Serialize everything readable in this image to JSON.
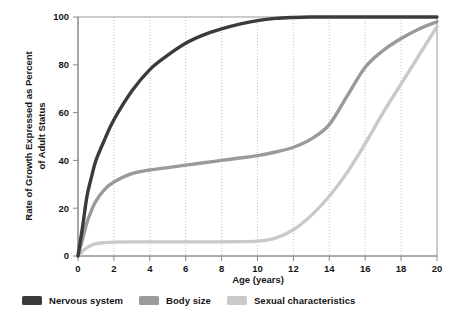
{
  "chart_data": {
    "type": "line",
    "title": "",
    "xlabel": "Age (years)",
    "ylabel": "Rate of Growth Expressed as Percent of Adult Status",
    "ylabel_line1": "Rate of Growth Expressed as Percent",
    "ylabel_line2": "of Adult Status",
    "xlim": [
      0,
      20
    ],
    "ylim": [
      0,
      100
    ],
    "xticks": [
      "0",
      "2",
      "4",
      "6",
      "8",
      "10",
      "12",
      "14",
      "16",
      "18",
      "20"
    ],
    "xtick_values": [
      0,
      2,
      4,
      6,
      8,
      10,
      12,
      14,
      16,
      18,
      20
    ],
    "yticks": [
      "0",
      "20",
      "40",
      "60",
      "80",
      "100"
    ],
    "ytick_values": [
      0,
      20,
      40,
      60,
      80,
      100
    ],
    "grid": "vertical-dotted",
    "legend_position": "below-plot",
    "x": [
      0,
      0.25,
      0.5,
      0.75,
      1,
      1.5,
      2,
      3,
      4,
      5,
      6,
      7,
      8,
      9,
      10,
      11,
      12,
      13,
      14,
      15,
      16,
      17,
      18,
      19,
      20
    ],
    "series": [
      {
        "name": "Nervous system",
        "color": "#3b3b3b",
        "values": [
          0,
          12,
          25,
          33,
          40,
          49,
          57,
          69,
          78,
          84,
          89,
          92.5,
          95,
          97,
          98.5,
          99.4,
          99.8,
          100,
          100,
          100,
          100,
          100,
          100,
          100,
          100
        ]
      },
      {
        "name": "Body size",
        "color": "#9a9a9a",
        "values": [
          0,
          7,
          14,
          19,
          23,
          28,
          31,
          34.5,
          36,
          37,
          38,
          39,
          40,
          41,
          42,
          43.5,
          45.5,
          49,
          55,
          67,
          79,
          86,
          91,
          95,
          98
        ]
      },
      {
        "name": "Sexual characteristics",
        "color": "#c9c9c9",
        "values": [
          0,
          2,
          3.5,
          4.5,
          5.2,
          5.6,
          5.8,
          5.9,
          5.9,
          5.9,
          5.9,
          5.9,
          5.9,
          6,
          6.2,
          7.5,
          11,
          17,
          25,
          35,
          47,
          60,
          72,
          84,
          96
        ]
      }
    ]
  },
  "legend": {
    "items": [
      {
        "label": "Nervous system",
        "color": "#3b3b3b"
      },
      {
        "label": "Body size",
        "color": "#9a9a9a"
      },
      {
        "label": "Sexual characteristics",
        "color": "#c9c9c9"
      }
    ]
  },
  "colors": {
    "nervous_system": "#3b3b3b",
    "body_size": "#9a9a9a",
    "sexual_characteristics": "#c9c9c9",
    "axis": "#8a8a8a",
    "grid": "#b4b4b4",
    "text": "#161616",
    "background": "#ffffff"
  }
}
